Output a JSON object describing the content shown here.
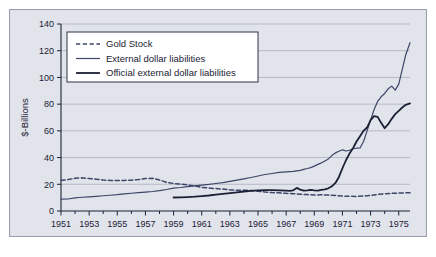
{
  "chart_data": {
    "type": "line",
    "title": "",
    "xlabel": "",
    "ylabel": "$-Billions",
    "xlim": [
      1951,
      1975.8
    ],
    "ylim": [
      0,
      140
    ],
    "ytick_step": 20,
    "yticks": [
      0,
      20,
      40,
      60,
      80,
      100,
      120,
      140
    ],
    "ytick_labels": [
      "0",
      "20",
      "40",
      "60",
      "80",
      "100",
      "120",
      "140"
    ],
    "xticks": [
      1951,
      1953,
      1955,
      1957,
      1959,
      1961,
      1963,
      1965,
      1967,
      1969,
      1971,
      1973,
      1975
    ],
    "xtick_labels": [
      "1951",
      "1953",
      "1955",
      "1957",
      "1959",
      "1961",
      "1963",
      "1965",
      "1967",
      "1969",
      "1971",
      "1973",
      "1975"
    ],
    "xtick_minor_step": 1,
    "grid": "horizontal",
    "grid_color": "#a9aebb",
    "legend_position": "top-left",
    "plot_background": "#e2e4ec",
    "series": [
      {
        "name": "Gold Stock",
        "style": "dashed",
        "color": "#3c4668",
        "width": 1.5,
        "x": [
          1951,
          1951.5,
          1952,
          1952.5,
          1953,
          1953.5,
          1954,
          1954.5,
          1955,
          1955.5,
          1956,
          1956.5,
          1957,
          1957.5,
          1958,
          1958.5,
          1959,
          1959.5,
          1960,
          1960.5,
          1961,
          1961.5,
          1962,
          1962.5,
          1963,
          1963.5,
          1964,
          1964.5,
          1965,
          1965.5,
          1966,
          1966.5,
          1967,
          1967.5,
          1968,
          1968.5,
          1969,
          1969.5,
          1970,
          1970.5,
          1971,
          1971.5,
          1972,
          1972.5,
          1973,
          1973.5,
          1974,
          1974.5,
          1975,
          1975.5,
          1975.8
        ],
        "y": [
          23.0,
          23.5,
          24.5,
          24.8,
          24.3,
          23.8,
          23.2,
          22.9,
          22.8,
          22.9,
          23.1,
          23.5,
          24.3,
          24.5,
          23.2,
          21.5,
          20.6,
          20.1,
          19.5,
          18.8,
          17.6,
          17.2,
          16.8,
          16.4,
          15.8,
          15.6,
          15.5,
          15.4,
          14.8,
          14.2,
          13.8,
          13.6,
          13.2,
          13.0,
          12.5,
          12.3,
          12.0,
          12.1,
          11.9,
          11.6,
          11.2,
          11.0,
          10.9,
          11.2,
          11.7,
          12.4,
          12.9,
          13.2,
          13.4,
          13.6,
          13.7
        ]
      },
      {
        "name": "External dollar liabilities",
        "style": "solid",
        "color": "#3c4668",
        "width": 1.2,
        "x": [
          1951,
          1951.5,
          1952,
          1952.5,
          1953,
          1953.5,
          1954,
          1954.5,
          1955,
          1955.5,
          1956,
          1956.5,
          1957,
          1957.5,
          1958,
          1958.5,
          1959,
          1959.5,
          1960,
          1960.5,
          1961,
          1961.5,
          1962,
          1962.5,
          1963,
          1963.5,
          1964,
          1964.5,
          1965,
          1965.5,
          1966,
          1966.5,
          1967,
          1967.5,
          1968,
          1968.25,
          1968.5,
          1968.75,
          1969,
          1969.25,
          1969.5,
          1969.75,
          1970,
          1970.25,
          1970.5,
          1970.75,
          1971,
          1971.25,
          1971.5,
          1971.75,
          1972,
          1972.25,
          1972.5,
          1972.75,
          1973,
          1973.25,
          1973.5,
          1973.75,
          1974,
          1974.25,
          1974.5,
          1974.75,
          1975,
          1975.25,
          1975.5,
          1975.8
        ],
        "y": [
          8.9,
          9.0,
          9.8,
          10.3,
          10.6,
          11.0,
          11.4,
          11.8,
          12.2,
          12.8,
          13.3,
          13.8,
          14.2,
          14.6,
          15.2,
          16.1,
          17.1,
          17.6,
          18.3,
          18.8,
          19.4,
          19.9,
          20.6,
          21.3,
          22.2,
          23.1,
          24.1,
          25.1,
          26.2,
          27.3,
          28.1,
          28.9,
          29.3,
          29.6,
          30.4,
          31.2,
          31.8,
          32.5,
          33.6,
          34.9,
          36.0,
          37.5,
          39.0,
          41.5,
          43.5,
          44.7,
          45.8,
          44.9,
          45.5,
          46.6,
          47.0,
          47.2,
          52.0,
          60.0,
          68.0,
          76.0,
          82.0,
          85.5,
          88.0,
          91.5,
          93.5,
          90.5,
          95.0,
          106.0,
          117.0,
          126.0
        ]
      },
      {
        "name": "Official external dollar liabilities",
        "style": "solid",
        "color": "#1b2134",
        "width": 1.8,
        "x": [
          1959,
          1959.5,
          1960,
          1960.5,
          1961,
          1961.5,
          1962,
          1962.5,
          1963,
          1963.5,
          1964,
          1964.5,
          1965,
          1965.5,
          1966,
          1966.5,
          1967,
          1967.25,
          1967.5,
          1967.75,
          1968,
          1968.25,
          1968.5,
          1968.75,
          1969,
          1969.25,
          1969.5,
          1969.75,
          1970,
          1970.25,
          1970.5,
          1970.75,
          1971,
          1971.25,
          1971.5,
          1971.75,
          1972,
          1972.25,
          1972.5,
          1972.75,
          1973,
          1973.25,
          1973.5,
          1973.75,
          1974,
          1974.25,
          1974.5,
          1974.75,
          1975,
          1975.25,
          1975.5,
          1975.8
        ],
        "y": [
          10.1,
          10.2,
          10.4,
          10.7,
          11.2,
          11.6,
          12.2,
          12.8,
          13.4,
          14.0,
          14.6,
          15.1,
          15.5,
          15.6,
          15.6,
          15.4,
          15.2,
          15.1,
          15.5,
          17.3,
          16.0,
          15.2,
          15.4,
          15.8,
          15.4,
          15.3,
          15.8,
          16.2,
          17.0,
          18.5,
          21.0,
          25.5,
          32.0,
          38.0,
          43.0,
          47.0,
          52.0,
          56.0,
          60.0,
          62.5,
          68.0,
          71.0,
          70.5,
          66.0,
          62.0,
          65.0,
          69.0,
          72.5,
          75.0,
          77.5,
          79.5,
          80.5
        ]
      }
    ]
  },
  "legend": {
    "items": [
      {
        "label": "Gold Stock",
        "style": "dashed"
      },
      {
        "label": "External dollar liabilities",
        "style": "solid-thin"
      },
      {
        "label": "Official external dollar liabilities",
        "style": "solid-thick"
      }
    ]
  },
  "axis": {
    "y_title": "$-Billions"
  }
}
